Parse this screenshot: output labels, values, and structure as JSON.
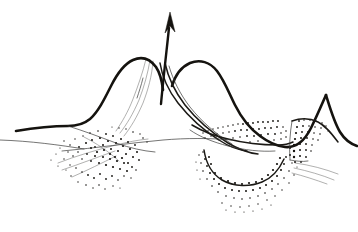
{
  "figure": {
    "background_color": "#ffffff",
    "ink_color": "#15130f",
    "faint_ink_color": "#7c7c7a",
    "width": 358,
    "height": 232
  },
  "elements": {
    "eruption_arrow": {
      "name": "Upward eruption arrow",
      "direction": "up",
      "tip": {
        "x": 170,
        "y": 12
      },
      "tail": {
        "x": 161,
        "y": 104
      }
    },
    "left_cone": {
      "name": "Left cone profile",
      "summit": {
        "x": 131,
        "y": 60
      },
      "base_left": {
        "x": 16,
        "y": 130
      }
    },
    "right_cone": {
      "name": "Right cone profile",
      "summit": {
        "x": 207,
        "y": 62
      },
      "base_right": {
        "x": 356,
        "y": 146
      }
    },
    "central_vent": {
      "name": "Central vent conduit",
      "top": {
        "x": 160,
        "y": 62
      },
      "bottom": {
        "x": 232,
        "y": 148
      }
    },
    "left_fault_zone": {
      "name": "Left stippled fault breccia wedge",
      "center": {
        "x": 95,
        "y": 155
      },
      "dot_count": 300
    },
    "right_inner_stipple": {
      "name": "Right cone inner stippled layer",
      "center": {
        "x": 248,
        "y": 125
      },
      "dot_count": 160
    },
    "basin_stipple": {
      "name": "Lower right stippled basin",
      "center": {
        "x": 250,
        "y": 175
      },
      "dot_count": 320
    },
    "right_wedge_block": {
      "name": "Right stippled wedge block",
      "center": {
        "x": 308,
        "y": 145
      },
      "dot_count": 110
    },
    "ground_line": {
      "name": "Horizontal ground reference line",
      "left": {
        "x": 62,
        "y": 151
      },
      "right": {
        "x": 232,
        "y": 140
      }
    }
  },
  "labels": {
    "visible_text": []
  }
}
